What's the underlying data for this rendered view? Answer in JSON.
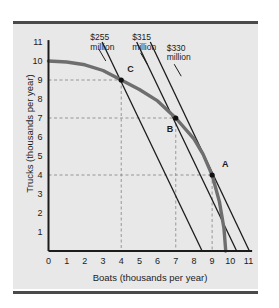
{
  "chart_data": {
    "type": "line",
    "title": "",
    "xlabel": "Boats (thousands per year)",
    "ylabel": "Trucks (thousands per year)",
    "xlim": [
      0,
      11
    ],
    "ylim": [
      0,
      11
    ],
    "xticks": [
      "0",
      "1",
      "2",
      "3",
      "4",
      "5",
      "6",
      "7",
      "8",
      "9",
      "10",
      "11"
    ],
    "yticks": [
      "0",
      "1",
      "2",
      "3",
      "4",
      "5",
      "6",
      "7",
      "8",
      "9",
      "10",
      "11"
    ],
    "grid": false,
    "legend": "none",
    "series": [
      {
        "name": "PPF",
        "style": "thick-gray-curve",
        "color": "#6e6e6e",
        "points": [
          [
            0.0,
            10.0
          ],
          [
            1.0,
            9.95
          ],
          [
            2.0,
            9.8
          ],
          [
            3.0,
            9.5
          ],
          [
            4.0,
            9.0
          ],
          [
            5.0,
            8.5
          ],
          [
            6.0,
            7.9
          ],
          [
            7.0,
            7.0
          ],
          [
            8.0,
            5.9
          ],
          [
            8.5,
            5.1
          ],
          [
            9.0,
            4.0
          ],
          [
            9.4,
            2.6
          ],
          [
            9.65,
            1.2
          ],
          [
            9.75,
            0.0
          ]
        ]
      },
      {
        "name": "$255 million",
        "style": "thin-black-line",
        "color": "#1c1c1c",
        "points": [
          [
            2.95,
            11.0
          ],
          [
            8.45,
            0.0
          ]
        ]
      },
      {
        "name": "$315 million",
        "style": "thin-black-line",
        "color": "#1c1c1c",
        "points": [
          [
            4.85,
            11.0
          ],
          [
            10.35,
            0.0
          ]
        ]
      },
      {
        "name": "$330 million",
        "style": "thin-black-line",
        "color": "#1c1c1c",
        "points": [
          [
            5.6,
            11.0
          ],
          [
            11.05,
            0.0
          ]
        ]
      }
    ],
    "annotations": [
      {
        "text": "$255",
        "text2": "million",
        "x": 2.3,
        "y": 11.35,
        "leader_to": [
          3.15,
          10.0
        ]
      },
      {
        "text": "$315",
        "text2": "million",
        "x": 4.6,
        "y": 11.35,
        "leader_to": [
          5.45,
          9.8
        ]
      },
      {
        "text": "$330",
        "text2": "million",
        "x": 6.5,
        "y": 10.8,
        "leader_to": [
          7.3,
          9.2
        ]
      }
    ],
    "points_of_interest": [
      {
        "label": "A",
        "x": 9.0,
        "y": 4.0,
        "label_dx": 10,
        "label_dy": -10
      },
      {
        "label": "B",
        "x": 7.0,
        "y": 7.0,
        "label_dx": -9,
        "label_dy": 12
      },
      {
        "label": "C",
        "x": 4.0,
        "y": 9.0,
        "label_dx": 6,
        "label_dy": -10
      }
    ],
    "guide_lines": {
      "style": "dashed",
      "color": "#8d8d8d",
      "horizontal_at_y": [
        9,
        7,
        4
      ],
      "vertical_at_x": [
        4,
        7,
        9
      ]
    },
    "colors": {
      "panel_background": "#e8e8e8",
      "axis": "#1c1c1c",
      "ppf_curve": "#6e6e6e",
      "cost_line": "#1c1c1c",
      "guide": "#8d8d8d",
      "rule": "#4a4a4a"
    }
  },
  "labels": {
    "cost_255_line1": "$255",
    "cost_255_line2": "million",
    "cost_315_line1": "$315",
    "cost_315_line2": "million",
    "cost_330_line1": "$330",
    "cost_330_line2": "million",
    "point_a": "A",
    "point_b": "B",
    "point_c": "C",
    "x_axis_title": "Boats (thousands per year)",
    "y_axis_title": "Trucks (thousands per year)"
  },
  "ticks": {
    "x": [
      "0",
      "1",
      "2",
      "3",
      "4",
      "5",
      "6",
      "7",
      "8",
      "9",
      "10",
      "11"
    ],
    "y": [
      "0",
      "1",
      "2",
      "3",
      "4",
      "5",
      "6",
      "7",
      "8",
      "9",
      "10",
      "11"
    ]
  }
}
